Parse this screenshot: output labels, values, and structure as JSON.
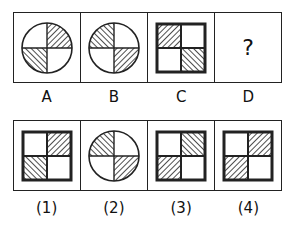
{
  "question_row": {
    "cells": [
      {
        "label": "A",
        "shape": "circle",
        "hatched": {
          "top-right": "forward",
          "bottom-left": "backward"
        }
      },
      {
        "label": "B",
        "shape": "circle",
        "hatched": {
          "top-left": "backward",
          "bottom-right": "forward"
        }
      },
      {
        "label": "C",
        "shape": "square",
        "hatched": {
          "top-left": "forward",
          "bottom-right": "backward"
        }
      },
      {
        "label": "D",
        "shape": "unknown",
        "symbol": "?"
      }
    ]
  },
  "options_row": {
    "cells": [
      {
        "label": "(1)",
        "shape": "square",
        "hatched": {
          "top-right": "forward",
          "bottom-left": "backward"
        }
      },
      {
        "label": "(2)",
        "shape": "circle",
        "hatched": {
          "top-left": "backward",
          "bottom-right": "forward"
        }
      },
      {
        "label": "(3)",
        "shape": "square",
        "hatched": {
          "top-right": "backward",
          "bottom-left": "forward"
        }
      },
      {
        "label": "(4)",
        "shape": "square",
        "hatched": {
          "top-right": "forward",
          "bottom-left": "forward"
        }
      }
    ]
  },
  "labels": {
    "a": "A",
    "b": "B",
    "c": "C",
    "d": "D",
    "unknown": "?",
    "o1": "(1)",
    "o2": "(2)",
    "o3": "(3)",
    "o4": "(4)"
  },
  "colors": {
    "line": "#222222",
    "background": "#ffffff"
  }
}
